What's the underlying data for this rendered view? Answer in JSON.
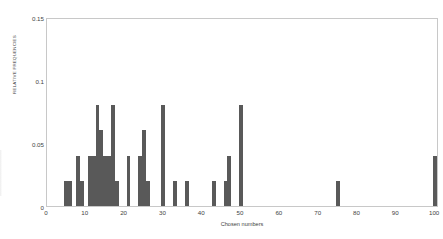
{
  "chart_data": {
    "type": "bar",
    "title": "",
    "xlabel": "Chosen numbers",
    "ylabel": "RELATIVE FREQUENCIES",
    "xlim": [
      0,
      101
    ],
    "ylim": [
      0,
      0.15
    ],
    "grid": false,
    "legend": null,
    "bar_color": "#595959",
    "frame_color": "#c8c8c8",
    "x_ticks": [
      0,
      10,
      20,
      30,
      40,
      50,
      60,
      70,
      80,
      90,
      100
    ],
    "x_tick_labels": [
      "0",
      "10",
      "20",
      "30",
      "40",
      "50",
      "60",
      "70",
      "80",
      "90",
      "100"
    ],
    "y_ticks": [
      0,
      0.05,
      0.1,
      0.15
    ],
    "y_tick_labels": [
      "0",
      "0.05",
      "0.1",
      "0.15"
    ],
    "x": [
      5,
      6,
      8,
      9,
      11,
      12,
      13,
      14,
      15,
      16,
      17,
      18,
      21,
      24,
      25,
      26,
      30,
      33,
      36,
      43,
      46,
      47,
      50,
      75,
      100
    ],
    "values": [
      0.02,
      0.02,
      0.04,
      0.02,
      0.04,
      0.04,
      0.08,
      0.06,
      0.04,
      0.04,
      0.08,
      0.02,
      0.04,
      0.04,
      0.06,
      0.02,
      0.08,
      0.02,
      0.02,
      0.02,
      0.02,
      0.04,
      0.08,
      0.02,
      0.04
    ],
    "bar_width": 1
  }
}
